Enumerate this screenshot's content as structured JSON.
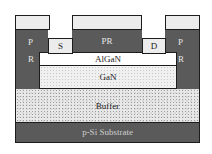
{
  "diagram": {
    "type": "semiconductor cross-section (HEMT fabrication step)",
    "layers": {
      "substrate": "p-Si Substrate",
      "buffer": "Buffer",
      "gan": "GaN",
      "algan": "AlGaN",
      "source": "S",
      "drain": "D",
      "pr_middle": "PR",
      "pr_left_top": "P",
      "pr_left_bottom": "R",
      "pr_right_top": "P",
      "pr_right_bottom": "R"
    },
    "colors": {
      "photoresist": "#5a5a5a",
      "substrate": "#5a5a5a",
      "outline": "#1c1c1c",
      "contact": "#ececec",
      "top_mask": "#ececec"
    }
  }
}
